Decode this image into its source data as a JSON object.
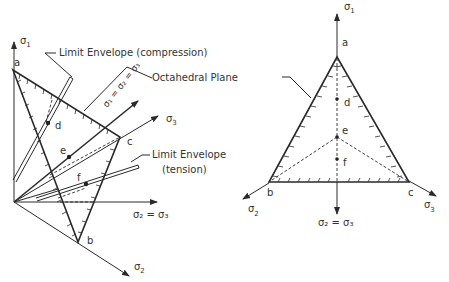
{
  "left_diagram": {
    "axes": {
      "sigma1": "σ",
      "sigma1_sub": "1",
      "sigma2": "σ",
      "sigma2_sub": "2",
      "sigma3": "σ",
      "sigma3_sub": "3",
      "sigma2_eq_sigma3": "σ₂ = σ₃"
    },
    "points": {
      "a": "a",
      "b": "b",
      "c": "c",
      "d": "d",
      "e": "e",
      "f": "f"
    },
    "callouts": {
      "compression": "Limit Envelope  (compression)",
      "octahedral": "Octahedral Plane",
      "tension_line1": "Limit Envelope",
      "tension_line2": "(tension)",
      "hydrostatic_axis": "σ₁ = σ₂ = σ₃"
    }
  },
  "right_diagram": {
    "axes": {
      "sigma1": "σ",
      "sigma1_sub": "1",
      "sigma2": "σ",
      "sigma2_sub": "2",
      "sigma3": "σ",
      "sigma3_sub": "3",
      "sigma2_eq_sigma3": "σ₂ = σ₃"
    },
    "points": {
      "a": "a",
      "b": "b",
      "c": "c",
      "d": "d",
      "e": "e",
      "f": "f"
    }
  }
}
